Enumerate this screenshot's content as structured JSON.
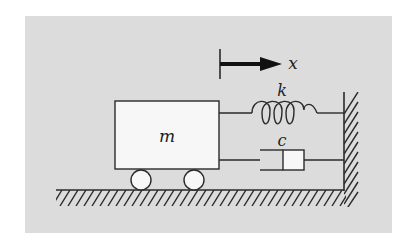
{
  "diagram": {
    "type": "mass-spring-damper",
    "colors": {
      "page_background": "#ffffff",
      "panel_background": "#dcdcdc",
      "stroke": "#2a2a2a",
      "mass_fill": "#f7f7f7",
      "wheel_fill": "#f7f7f7",
      "damper_piston_fill": "#f7f7f7",
      "arrow": "#111111"
    },
    "labels": {
      "mass": "m",
      "spring": "k",
      "damper": "c",
      "displacement": "x"
    },
    "components": [
      {
        "id": "mass",
        "label": "m",
        "shape": "rectangle"
      },
      {
        "id": "wheel-left",
        "shape": "circle"
      },
      {
        "id": "wheel-right",
        "shape": "circle"
      },
      {
        "id": "spring",
        "label": "k",
        "shape": "coil",
        "coils": 3
      },
      {
        "id": "damper",
        "label": "c",
        "shape": "dashpot"
      },
      {
        "id": "displacement-arrow",
        "label": "x",
        "direction": "right"
      },
      {
        "id": "ground",
        "shape": "hatched-line"
      },
      {
        "id": "wall",
        "shape": "hatched-line"
      }
    ]
  }
}
